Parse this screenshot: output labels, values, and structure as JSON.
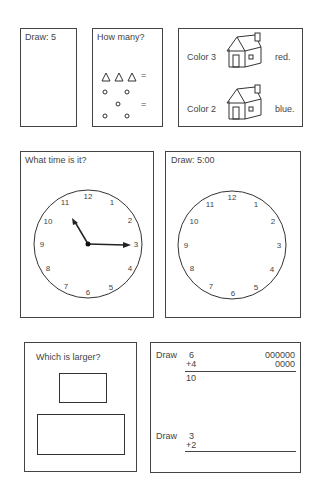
{
  "exercises": {
    "draw_five": {
      "prompt": "Draw:  5"
    },
    "how_many": {
      "prompt": "How many?",
      "triangles_symbol": "△△△",
      "equals": "=",
      "circles_equals": "="
    },
    "color_houses": {
      "row1": {
        "prefix": "Color 3",
        "suffix": "red."
      },
      "row2": {
        "prefix": "Color 2",
        "suffix": "blue."
      }
    },
    "what_time": {
      "prompt": "What time is it?",
      "clock_numbers": [
        "12",
        "1",
        "2",
        "3",
        "4",
        "5",
        "6",
        "7",
        "8",
        "9",
        "10",
        "11"
      ]
    },
    "draw_time": {
      "prompt": "Draw:  5:00",
      "clock_numbers": [
        "12",
        "1",
        "2",
        "3",
        "4",
        "5",
        "6",
        "7",
        "8",
        "9",
        "10",
        "11"
      ]
    },
    "which_larger": {
      "prompt": "Which is larger?"
    },
    "draw_sums": {
      "problem1": {
        "label": "Draw",
        "top": "6",
        "add": "+4",
        "result": "10",
        "dots_top": "000000",
        "dots_bottom": "0000"
      },
      "problem2": {
        "label": "Draw",
        "top": "3",
        "add": "+2"
      }
    }
  }
}
